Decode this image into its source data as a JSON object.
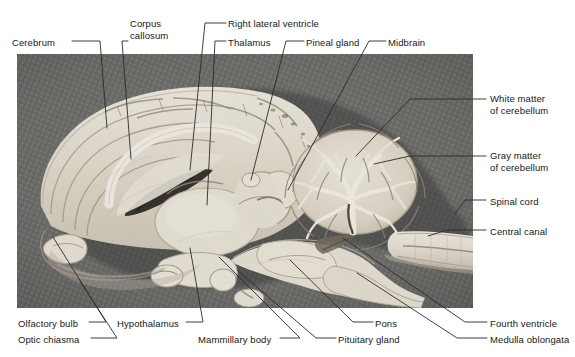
{
  "figure": {
    "type": "labeled-anatomical-photograph",
    "photo": {
      "subject": "sheep brain, midsagittal (medial) section",
      "style": "black-and-white photograph",
      "background": "dark gray woven fabric / textured cloth",
      "specimen_color": "#e3ddd2",
      "background_color": "#6a6a68",
      "frame": {
        "x": 17,
        "y": 54,
        "width": 456,
        "height": 254
      }
    },
    "leader_line_color": "#2b2b2b",
    "label_color": "#15171a"
  },
  "labels": [
    {
      "id": "cerebrum",
      "text": "Cerebrum",
      "side": "top-left",
      "text_x": 12,
      "text_y": 37,
      "align": "left",
      "lines": [
        "Cerebrum"
      ],
      "points": [
        [
          72,
          41
        ],
        [
          100,
          41
        ],
        [
          107,
          128
        ]
      ]
    },
    {
      "id": "corpus-callosum",
      "text": "Corpus callosum",
      "side": "top-left",
      "text_x": 130,
      "text_y": 18,
      "align": "left",
      "lines": [
        "Corpus",
        "callosum"
      ],
      "points": [
        [
          128,
          41
        ],
        [
          122,
          41
        ],
        [
          131,
          159
        ]
      ]
    },
    {
      "id": "right-lateral-ventricle",
      "text": "Right lateral ventricle",
      "side": "top-right",
      "text_x": 228,
      "text_y": 18,
      "align": "left",
      "lines": [
        "Right lateral ventricle"
      ],
      "points": [
        [
          226,
          23
        ],
        [
          205,
          23
        ],
        [
          190,
          170
        ]
      ]
    },
    {
      "id": "thalamus",
      "text": "Thalamus",
      "side": "top-right",
      "text_x": 228,
      "text_y": 37,
      "align": "left",
      "lines": [
        "Thalamus"
      ],
      "points": [
        [
          226,
          41
        ],
        [
          215,
          41
        ],
        [
          207,
          205
        ]
      ]
    },
    {
      "id": "pineal-gland",
      "text": "Pineal gland",
      "side": "top-right",
      "text_x": 306,
      "text_y": 37,
      "align": "left",
      "lines": [
        "Pineal gland"
      ],
      "points": [
        [
          304,
          41
        ],
        [
          286,
          41
        ],
        [
          251,
          180
        ]
      ]
    },
    {
      "id": "midbrain",
      "text": "Midbrain",
      "side": "top-right",
      "text_x": 388,
      "text_y": 37,
      "align": "left",
      "lines": [
        "Midbrain"
      ],
      "points": [
        [
          386,
          41
        ],
        [
          369,
          41
        ],
        [
          288,
          190
        ]
      ]
    },
    {
      "id": "white-matter-of-cerebellum",
      "text": "White matter of cerebellum",
      "side": "right",
      "text_x": 490,
      "text_y": 93,
      "align": "left",
      "lines": [
        "White matter",
        "of cerebellum"
      ],
      "points": [
        [
          486,
          99
        ],
        [
          410,
          99
        ],
        [
          356,
          156
        ]
      ]
    },
    {
      "id": "gray-matter-of-cerebellum",
      "text": "Gray matter of cerebellum",
      "side": "right",
      "text_x": 490,
      "text_y": 150,
      "align": "left",
      "lines": [
        "Gray matter",
        "of cerebellum"
      ],
      "points": [
        [
          486,
          156
        ],
        [
          410,
          156
        ],
        [
          374,
          164
        ]
      ]
    },
    {
      "id": "spinal-cord",
      "text": "Spinal cord",
      "side": "right",
      "text_x": 490,
      "text_y": 196,
      "align": "left",
      "lines": [
        "Spinal cord"
      ],
      "points": [
        [
          486,
          200
        ],
        [
          465,
          200
        ],
        [
          455,
          214
        ]
      ]
    },
    {
      "id": "central-canal",
      "text": "Central canal",
      "side": "right",
      "text_x": 490,
      "text_y": 226,
      "align": "left",
      "lines": [
        "Central canal"
      ],
      "points": [
        [
          486,
          230
        ],
        [
          447,
          230
        ],
        [
          428,
          236
        ]
      ]
    },
    {
      "id": "olfactory-bulb",
      "text": "Olfactory bulb",
      "side": "bottom-left",
      "text_x": 18,
      "text_y": 318,
      "align": "left",
      "lines": [
        "Olfactory bulb"
      ],
      "points": [
        [
          89,
          322
        ],
        [
          106,
          322
        ],
        [
          53,
          237
        ]
      ]
    },
    {
      "id": "optic-chiasma",
      "text": "Optic chiasma",
      "side": "bottom-left",
      "text_x": 18,
      "text_y": 334,
      "align": "left",
      "lines": [
        "Optic chiasma"
      ],
      "points": [
        [
          91,
          338
        ],
        [
          117,
          338
        ],
        [
          80,
          281
        ]
      ]
    },
    {
      "id": "hypothalamus",
      "text": "Hypothalamus",
      "side": "bottom-left",
      "text_x": 117,
      "text_y": 318,
      "align": "left",
      "lines": [
        "Hypothalamus"
      ],
      "points": [
        [
          186,
          322
        ],
        [
          203,
          322
        ],
        [
          190,
          248
        ]
      ]
    },
    {
      "id": "mammillary-body",
      "text": "Mammillary body",
      "side": "bottom",
      "text_x": 198,
      "text_y": 334,
      "align": "left",
      "lines": [
        "Mammillary body"
      ],
      "points": [
        [
          280,
          338
        ],
        [
          300,
          338
        ],
        [
          219,
          257
        ]
      ]
    },
    {
      "id": "pituitary-gland",
      "text": "Pituitary gland",
      "side": "bottom",
      "text_x": 338,
      "text_y": 334,
      "align": "left",
      "lines": [
        "Pituitary gland"
      ],
      "points": [
        [
          336,
          338
        ],
        [
          316,
          338
        ],
        [
          237,
          270
        ]
      ]
    },
    {
      "id": "pons",
      "text": "Pons",
      "side": "bottom",
      "text_x": 375,
      "text_y": 318,
      "align": "left",
      "lines": [
        "Pons"
      ],
      "points": [
        [
          373,
          322
        ],
        [
          353,
          322
        ],
        [
          290,
          260
        ]
      ]
    },
    {
      "id": "fourth-ventricle",
      "text": "Fourth ventricle",
      "side": "bottom-right",
      "text_x": 490,
      "text_y": 318,
      "align": "left",
      "lines": [
        "Fourth ventricle"
      ],
      "points": [
        [
          487,
          322
        ],
        [
          465,
          322
        ],
        [
          343,
          238
        ]
      ]
    },
    {
      "id": "medulla-oblongata",
      "text": "Medulla oblongata",
      "side": "bottom-right",
      "text_x": 490,
      "text_y": 334,
      "align": "left",
      "lines": [
        "Medulla oblongata"
      ],
      "points": [
        [
          487,
          338
        ],
        [
          457,
          338
        ],
        [
          357,
          273
        ]
      ]
    }
  ]
}
